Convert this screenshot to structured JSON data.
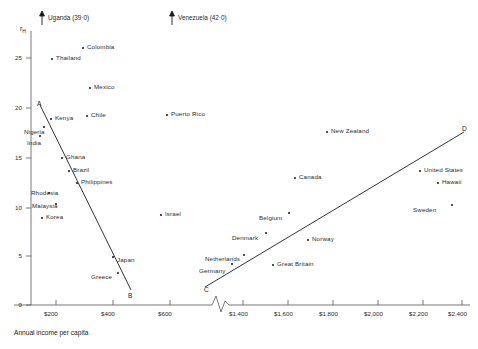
{
  "chart_data": {
    "type": "scatter",
    "title": "",
    "xlabel": "Annual income per capita",
    "ylabel": "rH",
    "ylabel_base": "r",
    "ylabel_sub": "H",
    "xticks": [
      "$200",
      "$400",
      "$600",
      "$1,400",
      "$1,600",
      "$1,800",
      "$2,000",
      "$2,200",
      "$2,400"
    ],
    "yticks": [
      "25",
      "20",
      "15",
      "10",
      "5",
      "0"
    ],
    "ylim": [
      0,
      27.5
    ],
    "grid": false,
    "legend": false,
    "axis_break": true,
    "annotations": [
      {
        "name": "uganda-offscale",
        "text": "Uganda (39·0)",
        "arrow": "up",
        "x": 48,
        "y": 18
      },
      {
        "name": "venezuela-offscale",
        "text": "Venezuela (42·0)",
        "arrow": "up",
        "x": 178,
        "y": 18
      }
    ],
    "points": [
      {
        "label": "Colombia",
        "income": 310,
        "rh": 26.0,
        "px": 82,
        "py": 47,
        "lx": 87,
        "ly": 44
      },
      {
        "label": "Thailand",
        "income": 205,
        "rh": 25.0,
        "px": 51,
        "py": 58,
        "lx": 56,
        "ly": 55
      },
      {
        "label": "Mexico",
        "income": 330,
        "rh": 22.0,
        "px": 89,
        "py": 87,
        "lx": 94,
        "ly": 84
      },
      {
        "label": "Chile",
        "income": 320,
        "rh": 19.3,
        "px": 86,
        "py": 115,
        "lx": 91,
        "ly": 112
      },
      {
        "label": "Puerto Rico",
        "income": 610,
        "rh": 19.4,
        "px": 166,
        "py": 114,
        "lx": 171,
        "ly": 111
      },
      {
        "label": "Kenya",
        "income": 145,
        "rh": 19.0,
        "px": 50,
        "py": 118,
        "lx": 55,
        "ly": 115
      },
      {
        "label": "Nigeria",
        "income": 110,
        "rh": 18.3,
        "px": 43,
        "py": 126,
        "lx": 24,
        "ly": 129
      },
      {
        "label": "India",
        "income": 100,
        "rh": 17.2,
        "px": 39,
        "py": 135,
        "lx": 27,
        "ly": 140
      },
      {
        "label": "New Zealand",
        "income": 1900,
        "rh": 16.8,
        "px": 326,
        "py": 131,
        "lx": 331,
        "ly": 128
      },
      {
        "label": "D",
        "income": 2500,
        "rh": 17.0,
        "px": 463,
        "py": 131,
        "lx": 462,
        "ly": 126,
        "endpoint": true
      },
      {
        "label": "A",
        "income": 120,
        "rh": 20.0,
        "px": 40,
        "py": 105,
        "lx": 37,
        "ly": 101,
        "endpoint": true
      },
      {
        "label": "Ghana",
        "income": 215,
        "rh": 14.3,
        "px": 61,
        "py": 157,
        "lx": 66,
        "ly": 154
      },
      {
        "label": "United States",
        "income": 2320,
        "rh": 13.0,
        "px": 419,
        "py": 170,
        "lx": 424,
        "ly": 167
      },
      {
        "label": "Brazil",
        "income": 250,
        "rh": 13.0,
        "px": 68,
        "py": 170,
        "lx": 73,
        "ly": 167
      },
      {
        "label": "Canada",
        "income": 1740,
        "rh": 12.5,
        "px": 294,
        "py": 177,
        "lx": 299,
        "ly": 174
      },
      {
        "label": "Hawaii",
        "income": 2400,
        "rh": 12.0,
        "px": 437,
        "py": 182,
        "lx": 442,
        "ly": 179
      },
      {
        "label": "Philippines",
        "income": 285,
        "rh": 12.1,
        "px": 76,
        "py": 182,
        "lx": 81,
        "ly": 179
      },
      {
        "label": "Rhodesia",
        "income": 135,
        "rh": 11.2,
        "px": 48,
        "py": 192,
        "lx": 31,
        "ly": 190
      },
      {
        "label": "Sweden",
        "income": 2430,
        "rh": 10.8,
        "px": 451,
        "py": 204,
        "lx": 413,
        "ly": 207
      },
      {
        "label": "Belgium",
        "income": 1680,
        "rh": 10.7,
        "px": 288,
        "py": 212,
        "lx": 259,
        "ly": 215
      },
      {
        "label": "Israel",
        "income": 420,
        "rh": 10.4,
        "px": 160,
        "py": 214,
        "lx": 165,
        "ly": 211
      },
      {
        "label": "Malaysia",
        "income": 155,
        "rh": 10.2,
        "px": 55,
        "py": 203,
        "lx": 32,
        "ly": 203
      },
      {
        "label": "Korea",
        "income": 120,
        "rh": 9.2,
        "px": 41,
        "py": 217,
        "lx": 46,
        "ly": 214
      },
      {
        "label": "Denmark",
        "income": 1590,
        "rh": 8.3,
        "px": 265,
        "py": 232,
        "lx": 232,
        "ly": 235
      },
      {
        "label": "Norway",
        "income": 1800,
        "rh": 7.7,
        "px": 307,
        "py": 239,
        "lx": 312,
        "ly": 236
      },
      {
        "label": "Netherlands",
        "income": 1470,
        "rh": 5.8,
        "px": 243,
        "py": 254,
        "lx": 205,
        "ly": 256
      },
      {
        "label": "Great Britain",
        "income": 1740,
        "rh": 5.5,
        "px": 272,
        "py": 264,
        "lx": 277,
        "ly": 261
      },
      {
        "label": "Japan",
        "income": 470,
        "rh": 5.4,
        "px": 112,
        "py": 256,
        "lx": 117,
        "ly": 257
      },
      {
        "label": "Germany",
        "income": 1420,
        "rh": 4.8,
        "px": 231,
        "py": 263,
        "lx": 199,
        "ly": 268
      },
      {
        "label": "Greece",
        "income": 440,
        "rh": 3.8,
        "px": 117,
        "py": 272,
        "lx": 91,
        "ly": 274
      },
      {
        "label": "C",
        "income": 1390,
        "rh": 2.0,
        "px": 206,
        "py": 286,
        "lx": 204,
        "ly": 287,
        "endpoint": true
      },
      {
        "label": "B",
        "income": 520,
        "rh": 1.5,
        "px": 129,
        "py": 291,
        "lx": 128,
        "ly": 293,
        "endpoint": true
      }
    ],
    "trend_lines": [
      {
        "name": "line-A-B",
        "from_label": "A",
        "to_label": "B",
        "x1": 40,
        "y1": 105,
        "x2": 131,
        "y2": 290
      },
      {
        "name": "line-C-D",
        "from_label": "C",
        "to_label": "D",
        "x1": 205,
        "y1": 287,
        "x2": 464,
        "y2": 132
      }
    ]
  }
}
